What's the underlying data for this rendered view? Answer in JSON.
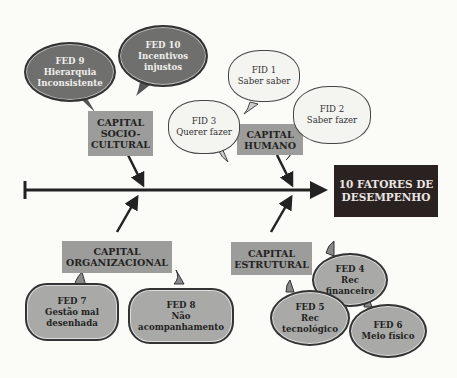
{
  "effect": {
    "line1": "10 FATORES DE",
    "line2": "DESEMPENHO"
  },
  "categories": {
    "sociocultural": {
      "l1": "CAPITAL",
      "l2": "SOCIO-",
      "l3": "CULTURAL"
    },
    "humano": {
      "l1": "CAPITAL",
      "l2": "HUMANO"
    },
    "organizacional": {
      "l1": "CAPITAL",
      "l2": "ORGANIZACIONAL"
    },
    "estrutural": {
      "l1": "CAPITAL",
      "l2": "ESTRUTURAL"
    }
  },
  "factors": {
    "fed9": {
      "id": "FED 9",
      "l1": "Hierarquia",
      "l2": "Inconsistente"
    },
    "fed10": {
      "id": "FED 10",
      "l1": "Incentivos",
      "l2": "injustos"
    },
    "fid1": {
      "id": "FID 1",
      "l1": "Saber saber"
    },
    "fid2": {
      "id": "FID 2",
      "l1": "Saber fazer"
    },
    "fid3": {
      "id": "FID 3",
      "l1": "Querer fazer"
    },
    "fed7": {
      "id": "FED 7",
      "l1": "Gestão mal",
      "l2": "desenhada"
    },
    "fed8": {
      "id": "FED 8",
      "l1": "Não",
      "l2": "acompanhamento"
    },
    "fed4": {
      "id": "FED 4",
      "l1": "Rec",
      "l2": "financeiro"
    },
    "fed5": {
      "id": "FED 5",
      "l1": "Rec",
      "l2": "tecnológico"
    },
    "fed6": {
      "id": "FED 6",
      "l1": "Meio físico"
    }
  }
}
